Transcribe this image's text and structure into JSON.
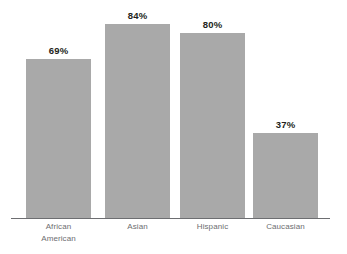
{
  "chart_data": {
    "type": "bar",
    "title": "",
    "subtitle": "",
    "xlabel": "",
    "ylabel": "",
    "ylim": [
      0,
      100
    ],
    "grid": false,
    "legend": false,
    "legend_position": "none",
    "orientation": "vertical",
    "categories": [
      "African American",
      "Asian",
      "Hispanic",
      "Caucasian"
    ],
    "values": [
      69,
      84,
      80,
      37
    ],
    "value_labels": [
      "69%",
      "84%",
      "80%",
      "37%"
    ],
    "bar_color": "#a9a9a9",
    "axis_color": "#6d6e71",
    "value_label_color": "#231f20",
    "category_label_color": "#6d6e71",
    "background_color": "#ffffff",
    "bars": [
      {
        "category": "African American",
        "category_line1": "African",
        "category_line2": "American",
        "value": 69,
        "value_label": "69%"
      },
      {
        "category": "Asian",
        "category_line1": "Asian",
        "category_line2": "",
        "value": 84,
        "value_label": "84%"
      },
      {
        "category": "Hispanic",
        "category_line1": "Hispanic",
        "category_line2": "",
        "value": 80,
        "value_label": "80%"
      },
      {
        "category": "Caucasian",
        "category_line1": "Caucasian",
        "category_line2": "",
        "value": 37,
        "value_label": "37%"
      }
    ]
  }
}
